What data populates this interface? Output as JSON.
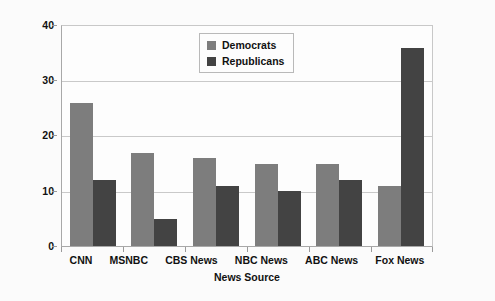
{
  "chart_data": {
    "type": "bar",
    "title": "",
    "xlabel": "News Source",
    "ylabel": "Percent Who Watch Regularly",
    "categories": [
      "CNN",
      "MSNBC",
      "CBS News",
      "NBC News",
      "ABC News",
      "Fox News"
    ],
    "series": [
      {
        "name": "Democrats",
        "color": "#7d7d7d",
        "values": [
          26,
          17,
          16,
          15,
          15,
          11
        ]
      },
      {
        "name": "Republicans",
        "color": "#434343",
        "values": [
          12,
          5,
          11,
          10,
          12,
          36
        ]
      }
    ],
    "ylim": [
      0,
      40
    ],
    "yticks": [
      0,
      10,
      20,
      30,
      40
    ],
    "ytick_labels": [
      "0",
      "10",
      "20",
      "30",
      "40"
    ],
    "grid": true,
    "grid_axis": "y",
    "legend_position": "upper center",
    "bar_group_order": [
      "Democrats",
      "Republicans"
    ]
  },
  "legend": {
    "entries": [
      {
        "label": "Democrats",
        "swatch_name": "legend-swatch-democrats"
      },
      {
        "label": "Republicans",
        "swatch_name": "legend-swatch-republicans"
      }
    ]
  },
  "colors": {
    "democrats": "#7d7d7d",
    "republicans": "#434343",
    "gridline": "#c9c9c9",
    "axis": "#a8a8a8",
    "plot_background": "#fdfdfd",
    "figure_background": "#fbfbfb",
    "text": "#111111"
  }
}
